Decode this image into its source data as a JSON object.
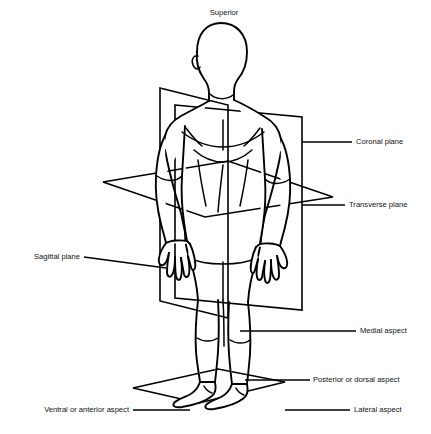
{
  "figure": {
    "line_color": "#000000",
    "text_color": "#111111",
    "background_color": "#ffffff"
  },
  "labels": {
    "superior": "Superior",
    "coronal_plane": "Coronal plane",
    "transverse_plane": "Transverse plane",
    "sagittal_plane": "Sagittal plane",
    "medial_aspect": "Medial aspect",
    "posterior_or_dorsal_aspect": "Posterior or dorsal aspect",
    "ventral_or_anterior_aspect": "Ventral or anterior aspect",
    "lateral_aspect": "Lateral aspect"
  },
  "planes": {
    "coronal": {
      "name": "Coronal plane",
      "orientation": "frontal-vertical",
      "label_side": "right"
    },
    "transverse": {
      "name": "Transverse plane",
      "orientation": "horizontal",
      "label_side": "right"
    },
    "sagittal": {
      "name": "Sagittal plane",
      "orientation": "median-vertical",
      "label_side": "left"
    },
    "ground": {
      "name": "Ground plane",
      "orientation": "horizontal"
    }
  },
  "aspects": [
    {
      "key": "superior",
      "label": "Superior",
      "position": "top"
    },
    {
      "key": "medial",
      "label": "Medial aspect",
      "position": "right"
    },
    {
      "key": "posterior",
      "label": "Posterior or dorsal aspect",
      "position": "right"
    },
    {
      "key": "lateral",
      "label": "Lateral aspect",
      "position": "right"
    },
    {
      "key": "ventral",
      "label": "Ventral or anterior aspect",
      "position": "left"
    }
  ]
}
